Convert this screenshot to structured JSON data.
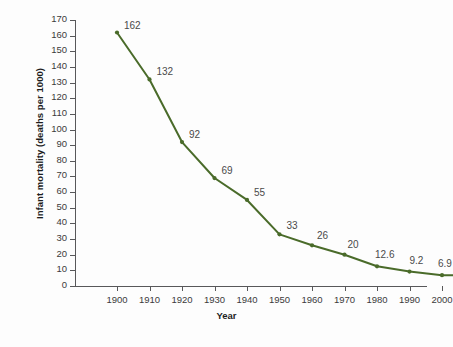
{
  "chart_data": {
    "type": "line",
    "title": "",
    "xlabel": "Year",
    "ylabel": "Infant mortality (deaths per 1000)",
    "categories": [
      "1900",
      "1910",
      "1920",
      "1930",
      "1940",
      "1950",
      "1960",
      "1970",
      "1980",
      "1990",
      "2000",
      "2007"
    ],
    "values": [
      162,
      132,
      92,
      69,
      55,
      33,
      26,
      20,
      12.6,
      9.2,
      6.9,
      6.8
    ],
    "point_labels": [
      "162",
      "132",
      "92",
      "69",
      "55",
      "33",
      "26",
      "20",
      "12.6",
      "9.2",
      "6.9",
      "6.8"
    ],
    "ylim": [
      0,
      170
    ],
    "ytick_labels": [
      "170",
      "160",
      "150",
      "140",
      "130",
      "120",
      "110",
      "100",
      "90",
      "80",
      "70",
      "60",
      "50",
      "40",
      "30",
      "20",
      "10",
      "0"
    ],
    "ytick_values": [
      170,
      160,
      150,
      140,
      130,
      120,
      110,
      100,
      90,
      80,
      70,
      60,
      50,
      40,
      30,
      20,
      10,
      0
    ],
    "grid": false,
    "legend": false,
    "series_color": "#4a6b2a",
    "axis_color": "#58585a",
    "label_color": "#4a4a4a",
    "background": "#fdfdfd",
    "rotated_xticks": [
      "2007"
    ]
  },
  "caption": {
    "text": ""
  }
}
